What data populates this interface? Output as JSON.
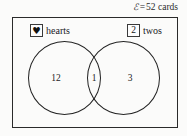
{
  "diagram": {
    "universe": {
      "symbol": "ℰ",
      "equals": "=",
      "value": "52 cards",
      "caption": "ℰ = 52 cards"
    },
    "sets": [
      {
        "id": "hearts",
        "key_glyph": "♥",
        "key_icon_name": "heart-suit-icon",
        "label": "hearts"
      },
      {
        "id": "twos",
        "key_glyph": "2",
        "key_icon_name": "rank-two-icon",
        "label": "twos"
      }
    ],
    "regions": [
      {
        "id": "hearts-only",
        "value": "12"
      },
      {
        "id": "hearts-and-twos",
        "value": "1"
      },
      {
        "id": "twos-only",
        "value": "3"
      }
    ],
    "colors": {
      "stroke": "#232323",
      "background": "#fbfbfa",
      "text": "#242424"
    }
  }
}
